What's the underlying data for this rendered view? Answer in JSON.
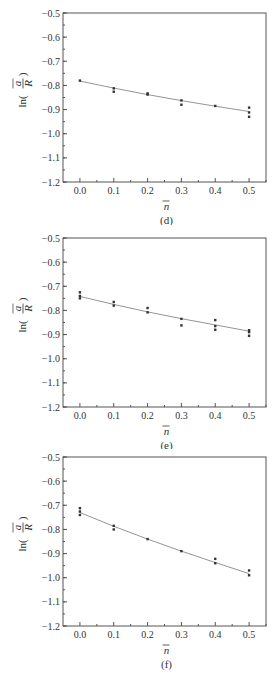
{
  "chart_data": [
    {
      "type": "scatter",
      "panel_label": "(d)",
      "title": "",
      "xlabel": "n̄",
      "ylabel": "ln(a/R)",
      "xlim": [
        -0.05,
        0.55
      ],
      "ylim": [
        -1.2,
        -0.5
      ],
      "xticks": [
        "0.0",
        "0.1",
        "0.2",
        "0.3",
        "0.4",
        "0.5"
      ],
      "yticks": [
        "-0.5",
        "-0.6",
        "-0.7",
        "-0.8",
        "-0.9",
        "-1.0",
        "-1.1",
        "-1.2"
      ],
      "grid": false,
      "series": [
        {
          "name": "fit",
          "kind": "line",
          "x": [
            0.0,
            0.1,
            0.2,
            0.3,
            0.4,
            0.5
          ],
          "values": [
            -0.782,
            -0.811,
            -0.838,
            -0.863,
            -0.886,
            -0.908
          ]
        },
        {
          "name": "data",
          "kind": "scatter",
          "x": [
            0.0,
            0.1,
            0.1,
            0.2,
            0.2,
            0.3,
            0.3,
            0.4,
            0.5,
            0.5,
            0.5
          ],
          "values": [
            -0.78,
            -0.812,
            -0.826,
            -0.833,
            -0.838,
            -0.862,
            -0.88,
            -0.885,
            -0.892,
            -0.912,
            -0.93
          ]
        }
      ]
    },
    {
      "type": "scatter",
      "panel_label": "(e)",
      "title": "",
      "xlabel": "n̄",
      "ylabel": "ln(a/R)",
      "xlim": [
        -0.05,
        0.55
      ],
      "ylim": [
        -1.2,
        -0.5
      ],
      "xticks": [
        "0.0",
        "0.1",
        "0.2",
        "0.3",
        "0.4",
        "0.5"
      ],
      "yticks": [
        "-0.5",
        "-0.6",
        "-0.7",
        "-0.8",
        "-0.9",
        "-1.0",
        "-1.1",
        "-1.2"
      ],
      "grid": false,
      "series": [
        {
          "name": "fit",
          "kind": "line",
          "x": [
            0.0,
            0.1,
            0.2,
            0.3,
            0.4,
            0.5
          ],
          "values": [
            -0.742,
            -0.775,
            -0.806,
            -0.834,
            -0.86,
            -0.886
          ]
        },
        {
          "name": "data",
          "kind": "scatter",
          "x": [
            0.0,
            0.0,
            0.0,
            0.1,
            0.1,
            0.2,
            0.2,
            0.3,
            0.3,
            0.4,
            0.4,
            0.4,
            0.5,
            0.5,
            0.5
          ],
          "values": [
            -0.725,
            -0.74,
            -0.75,
            -0.765,
            -0.78,
            -0.79,
            -0.808,
            -0.835,
            -0.862,
            -0.84,
            -0.865,
            -0.88,
            -0.882,
            -0.89,
            -0.905
          ]
        }
      ]
    },
    {
      "type": "scatter",
      "panel_label": "(f)",
      "title": "",
      "xlabel": "n̄",
      "ylabel": "ln(a/R)",
      "xlim": [
        -0.05,
        0.55
      ],
      "ylim": [
        -1.2,
        -0.5
      ],
      "xticks": [
        "0.0",
        "0.1",
        "0.2",
        "0.3",
        "0.4",
        "0.5"
      ],
      "yticks": [
        "-0.5",
        "-0.6",
        "-0.7",
        "-0.8",
        "-0.9",
        "-1.0",
        "-1.1",
        "-1.2"
      ],
      "grid": false,
      "series": [
        {
          "name": "fit",
          "kind": "line",
          "x": [
            0.0,
            0.1,
            0.2,
            0.3,
            0.4,
            0.5
          ],
          "values": [
            -0.73,
            -0.787,
            -0.84,
            -0.89,
            -0.937,
            -0.983
          ]
        },
        {
          "name": "data",
          "kind": "scatter",
          "x": [
            0.0,
            0.0,
            0.0,
            0.1,
            0.1,
            0.2,
            0.3,
            0.4,
            0.4,
            0.5,
            0.5
          ],
          "values": [
            -0.712,
            -0.726,
            -0.74,
            -0.785,
            -0.8,
            -0.84,
            -0.89,
            -0.922,
            -0.94,
            -0.97,
            -0.99
          ]
        }
      ]
    }
  ],
  "panels": [
    {
      "label": "(d)"
    },
    {
      "label": "(e)"
    },
    {
      "label": "(f)"
    }
  ],
  "axis": {
    "xlabel": "n",
    "ylabel_prefix": "ln",
    "ylabel_num": "a",
    "ylabel_den": "R"
  },
  "colors": {
    "line": "#888888",
    "point": "#333333",
    "axis": "#555555"
  }
}
